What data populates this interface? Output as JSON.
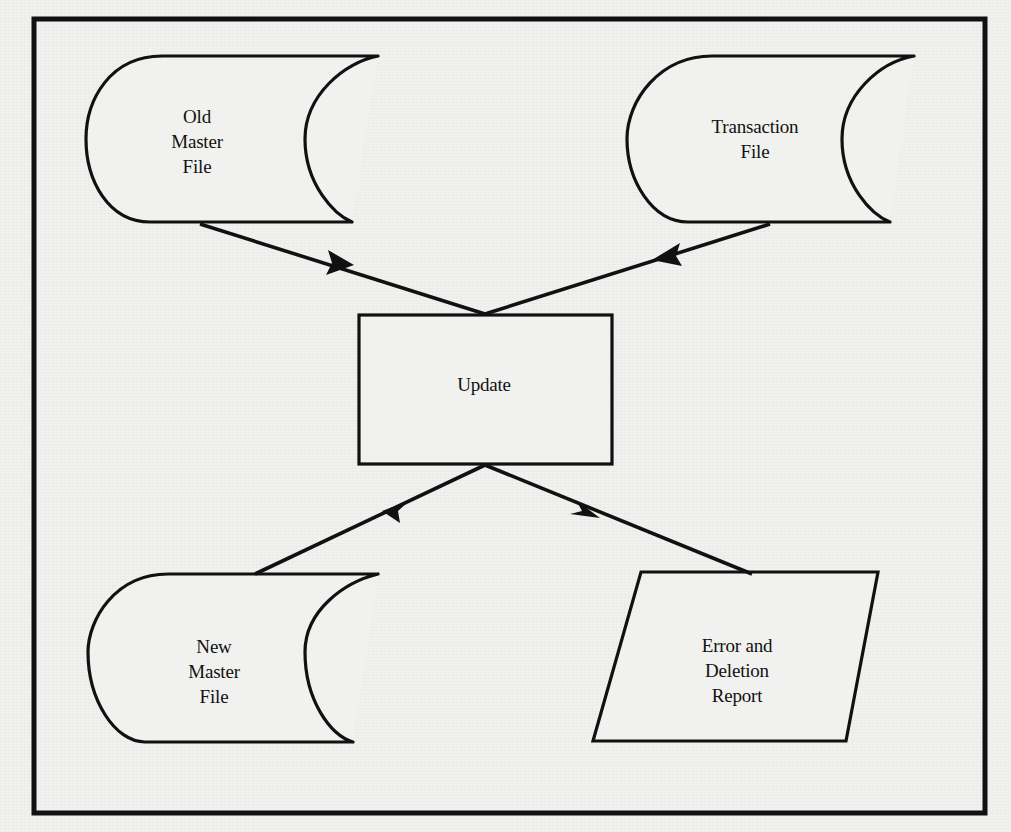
{
  "diagram": {
    "type": "flowchart",
    "colors": {
      "stroke": "#111111",
      "background": "#f1f1ef",
      "text": "#111111"
    },
    "nodes": {
      "old_master_file": {
        "shape": "stored-data",
        "lines": [
          "Old",
          "Master",
          "File"
        ]
      },
      "transaction_file": {
        "shape": "stored-data",
        "lines": [
          "Transaction",
          "File"
        ]
      },
      "update": {
        "shape": "process",
        "lines": [
          "Update"
        ]
      },
      "new_master_file": {
        "shape": "stored-data",
        "lines": [
          "New",
          "Master",
          "File"
        ]
      },
      "error_report": {
        "shape": "input-output",
        "lines": [
          "Error and",
          "Deletion",
          "Report"
        ]
      }
    },
    "edges": [
      {
        "from": "Old Master File",
        "to": "Update"
      },
      {
        "from": "Transaction File",
        "to": "Update"
      },
      {
        "from": "Update",
        "to": "New Master File"
      },
      {
        "from": "Update",
        "to": "Error and Deletion Report"
      }
    ]
  }
}
